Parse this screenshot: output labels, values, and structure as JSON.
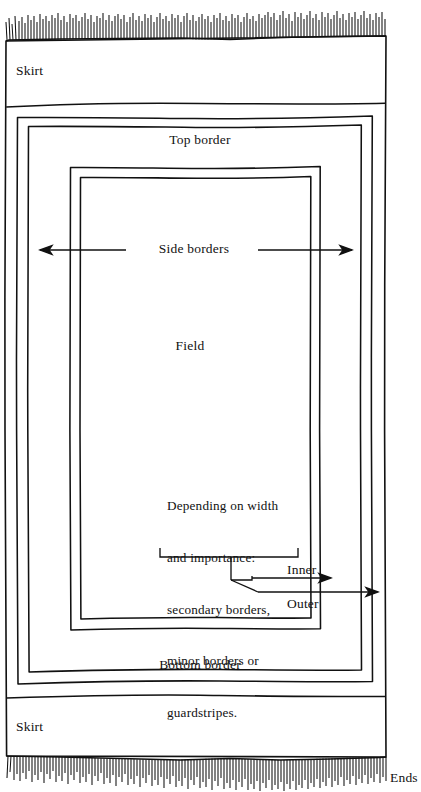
{
  "diagram": {
    "style": "hand-drawn line drawing, black on white",
    "colors": {
      "ink": "#111111",
      "paper": "#ffffff"
    }
  },
  "labels": {
    "skirt_top": "Skirt",
    "skirt_bottom": "Skirt",
    "top_border": "Top border",
    "bottom_border": "Bottom border",
    "side_borders": "Side borders",
    "field": "Field",
    "inner": "Inner",
    "outer": "Outer",
    "ends": "Ends"
  },
  "note": {
    "lines": [
      "Depending on width",
      "and importance:",
      "secondary borders,",
      "minor borders or",
      "guardstripes."
    ]
  },
  "parts": [
    {
      "name": "ends-fringe-top",
      "label": "Ends"
    },
    {
      "name": "skirt-top",
      "label": "Skirt"
    },
    {
      "name": "top-border",
      "label": "Top border"
    },
    {
      "name": "side-borders",
      "label": "Side borders"
    },
    {
      "name": "field",
      "label": "Field"
    },
    {
      "name": "inner-guardstripe",
      "label": "Inner"
    },
    {
      "name": "outer-guardstripe",
      "label": "Outer"
    },
    {
      "name": "bottom-border",
      "label": "Bottom border"
    },
    {
      "name": "skirt-bottom",
      "label": "Skirt"
    },
    {
      "name": "ends-fringe-bottom",
      "label": "Ends"
    }
  ]
}
